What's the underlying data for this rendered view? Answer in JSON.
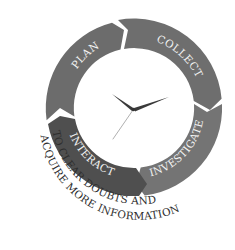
{
  "diagram": {
    "type": "cycle",
    "segments": [
      {
        "label": "PLAN",
        "color": "#6c6c6c"
      },
      {
        "label": "COLLECT",
        "color": "#6e6e6e"
      },
      {
        "label": "INVESTIGATE",
        "color": "#747474"
      },
      {
        "label": "INTERACT",
        "color": "#4f4f4f"
      }
    ],
    "caption_line1": "TO CLEAR DOUBTS AND",
    "caption_line2": "ACQUIRE MORE INFORMATION",
    "center_icon": "clock-icon",
    "colors": {
      "background": "#ffffff",
      "hour_hand": "#3a3a3a",
      "minute_hand": "#3a3a3a",
      "second_hand": "#b0b0b0",
      "caption": "#2e2e2e",
      "label": "#f2f2f2"
    }
  }
}
